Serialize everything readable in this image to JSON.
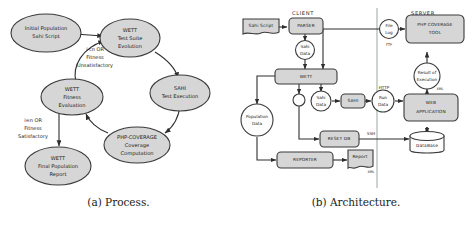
{
  "figure": {
    "subfigures": [
      {
        "id": "a",
        "caption": "(a) Process."
      },
      {
        "id": "b",
        "caption": "(b) Architecture."
      }
    ]
  },
  "process_diagram": {
    "caption": "(a) Process.",
    "node_fill_color": "#d6d6d6",
    "node_stroke_color": "#3a3a3a",
    "nodes": [
      {
        "id": "initial-population",
        "shape": "ellipse",
        "lines": [
          "Initial Population",
          "Sahi Script"
        ]
      },
      {
        "id": "wett-test-suite-evolution",
        "shape": "ellipse",
        "lines": [
          "WETT",
          "Test Suite",
          "Evolution"
        ]
      },
      {
        "id": "sahi-test-execution",
        "shape": "ellipse",
        "lines": [
          "SAHI",
          "Test Execution"
        ]
      },
      {
        "id": "php-coverage-computation",
        "shape": "ellipse",
        "lines": [
          "PHP-COVERAGE",
          "Coverage",
          "Computation"
        ]
      },
      {
        "id": "wett-fitness-evaluation",
        "shape": "ellipse",
        "lines": [
          "WETT",
          "Fitness",
          "Evaluation"
        ]
      },
      {
        "id": "wett-final-population-report",
        "shape": "ellipse",
        "lines": [
          "WETT",
          "Final Population",
          "Report"
        ]
      }
    ],
    "edge_labels": [
      {
        "id": "loop-back-label",
        "lines": [
          "i<n OR",
          "Fitness",
          "Unsatisfactory"
        ]
      },
      {
        "id": "exit-label",
        "lines": [
          "i=n OR",
          "Fitness",
          "Satisfactory"
        ]
      }
    ],
    "edges": [
      {
        "from": "initial-population",
        "to": "wett-test-suite-evolution",
        "label": ""
      },
      {
        "from": "wett-test-suite-evolution",
        "to": "sahi-test-execution",
        "label": ""
      },
      {
        "from": "sahi-test-execution",
        "to": "php-coverage-computation",
        "label": ""
      },
      {
        "from": "php-coverage-computation",
        "to": "wett-fitness-evaluation",
        "label": ""
      },
      {
        "from": "wett-fitness-evaluation",
        "to": "wett-test-suite-evolution",
        "label": "i<n OR Fitness Unsatisfactory"
      },
      {
        "from": "wett-fitness-evaluation",
        "to": "wett-final-population-report",
        "label": "i=n OR Fitness Satisfactory"
      }
    ]
  },
  "architecture_diagram": {
    "caption": "(b) Architecture.",
    "zones": [
      {
        "id": "client-zone",
        "label": "CLIENT"
      },
      {
        "id": "server-zone",
        "label": "SERVER"
      }
    ],
    "nodes": [
      {
        "id": "sahi-script",
        "shape": "document",
        "label": "Sahi Script"
      },
      {
        "id": "parser",
        "shape": "rounded-box",
        "label": "PARSER"
      },
      {
        "id": "sahi-data-top",
        "shape": "circle",
        "lines": [
          "Sahi",
          "Data"
        ]
      },
      {
        "id": "wett",
        "shape": "rounded-box",
        "label": "WETT"
      },
      {
        "id": "junction",
        "shape": "circle",
        "label": ""
      },
      {
        "id": "population-data",
        "shape": "circle",
        "lines": [
          "Population",
          "Data"
        ]
      },
      {
        "id": "sahi-data-mid",
        "shape": "circle",
        "lines": [
          "Sahi",
          "Data"
        ]
      },
      {
        "id": "sahi",
        "shape": "rounded-box",
        "label": "SAHI"
      },
      {
        "id": "run-data",
        "shape": "circle",
        "lines": [
          "Run",
          "Data"
        ]
      },
      {
        "id": "reset-db",
        "shape": "rounded-box",
        "label": "RESET DB"
      },
      {
        "id": "reporter",
        "shape": "rounded-box",
        "label": "REPORTER"
      },
      {
        "id": "report",
        "shape": "document",
        "label": "Report",
        "annotation": "XML"
      },
      {
        "id": "file-log",
        "shape": "circle",
        "lines": [
          "File",
          "Log"
        ],
        "annotation": "FTP"
      },
      {
        "id": "php-coverage-tool",
        "shape": "rounded-box",
        "lines": [
          "PHP COVERAGE",
          "TOOL"
        ]
      },
      {
        "id": "result-of-execution",
        "shape": "circle",
        "lines": [
          "Result of",
          "Execution"
        ],
        "annotation": "XML"
      },
      {
        "id": "web-application",
        "shape": "rounded-box",
        "lines": [
          "WEB",
          "APPLICATION"
        ]
      },
      {
        "id": "database",
        "shape": "cylinder",
        "label": "DataBase"
      }
    ],
    "protocol_labels": [
      {
        "id": "ftp-label",
        "text": "FTP"
      },
      {
        "id": "http-label",
        "text": "HTTP"
      },
      {
        "id": "ssh-label",
        "text": "SSH"
      },
      {
        "id": "xml-label-result",
        "text": "XML"
      },
      {
        "id": "xml-label-report",
        "text": "XML"
      }
    ]
  }
}
